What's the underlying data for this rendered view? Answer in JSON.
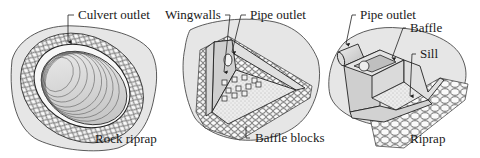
{
  "figure": {
    "panels": [
      {
        "id": "culvert",
        "labels": {
          "top": "Culvert outlet",
          "bottom": "Rock riprap"
        }
      },
      {
        "id": "wingwall",
        "labels": {
          "top_left": "Wingwalls",
          "top_right": "Pipe outlet",
          "bottom": "Baffle blocks"
        }
      },
      {
        "id": "baffle",
        "labels": {
          "top_left": "Pipe outlet",
          "right_1": "Baffle",
          "right_2": "Sill",
          "bottom": "Riprap"
        }
      }
    ],
    "colors": {
      "ground": "#e6e6e6",
      "rock": "#f4f4f4",
      "line": "#222222",
      "concrete": "#d9d9d9",
      "pipe_interior": "#c8c8c8"
    }
  }
}
